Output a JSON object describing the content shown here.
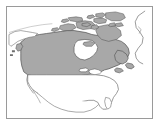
{
  "figure": {
    "type": "locator-map",
    "frame": {
      "border_color": "#9a9a9a",
      "background_color": "#ffffff",
      "x": 6,
      "y": 6,
      "width": 147,
      "height": 113
    }
  },
  "map": {
    "projection_note": "north-polar-ish continental view",
    "land_outline_color": "#6e6e6e",
    "water_color": "#ffffff",
    "highlight_fill": "#a8a8a8",
    "highlight_stroke": "#4d4d4d",
    "regions": [
      {
        "name": "Canada",
        "label": "Canada",
        "highlighted": true,
        "fill": "#a8a8a8",
        "stroke": "#4d4d4d"
      },
      {
        "name": "United States",
        "label": "United States",
        "highlighted": false,
        "fill": "#ffffff",
        "stroke": "#6e6e6e"
      },
      {
        "name": "Greenland",
        "label": "Greenland",
        "highlighted": false,
        "fill": "#ffffff",
        "stroke": "#6e6e6e"
      },
      {
        "name": "Alaska",
        "label": "Alaska",
        "highlighted": false,
        "fill": "#ffffff",
        "stroke": "#6e6e6e"
      },
      {
        "name": "Mexico",
        "label": "Mexico",
        "highlighted": false,
        "fill": "#ffffff",
        "stroke": "#6e6e6e"
      }
    ],
    "water_bodies": [
      {
        "name": "Hudson Bay",
        "label": "Hudson Bay",
        "fill": "#ffffff"
      },
      {
        "name": "Great Lakes",
        "label": "Great Lakes",
        "fill": "#ffffff"
      },
      {
        "name": "Gulf of Mexico",
        "label": "Gulf of Mexico",
        "fill": "#ffffff"
      }
    ],
    "island_groups": [
      {
        "name": "Arctic Archipelago",
        "label": "Canadian Arctic Archipelago",
        "fill": "#a8a8a8"
      }
    ]
  }
}
